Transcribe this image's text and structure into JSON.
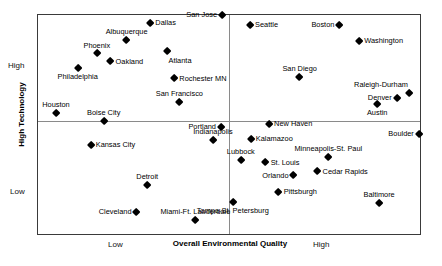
{
  "chart_data": {
    "type": "scatter",
    "title": "",
    "xlabel": "Overall Environmental Quality",
    "ylabel": "High Technology",
    "xlim": [
      0,
      100
    ],
    "ylim": [
      0,
      100
    ],
    "grid": false,
    "legend": "none",
    "x_tick_labels": [
      "Low",
      "High"
    ],
    "y_tick_labels": [
      "High",
      "Low"
    ],
    "quadrant_divider_x": 50,
    "quadrant_divider_y": 51.6,
    "points": [
      {
        "label": "San Jose",
        "x": 48.2,
        "y": 100.0,
        "pos": "left"
      },
      {
        "label": "Dallas",
        "x": 29.4,
        "y": 96.4,
        "pos": "right"
      },
      {
        "label": "Seattle",
        "x": 55.5,
        "y": 95.5,
        "pos": "right"
      },
      {
        "label": "Boston",
        "x": 78.9,
        "y": 95.5,
        "pos": "left"
      },
      {
        "label": "Albuquerque",
        "x": 23.2,
        "y": 88.7,
        "pos": "above"
      },
      {
        "label": "Washington",
        "x": 84.1,
        "y": 88.2,
        "pos": "right"
      },
      {
        "label": "Phoenix",
        "x": 15.4,
        "y": 82.4,
        "pos": "above"
      },
      {
        "label": "Atlanta",
        "x": 33.9,
        "y": 83.3,
        "pos": "belowright"
      },
      {
        "label": "Oakland",
        "x": 19.0,
        "y": 78.7,
        "pos": "right"
      },
      {
        "label": "Philadelphia",
        "x": 10.4,
        "y": 75.6,
        "pos": "below"
      },
      {
        "label": "San Diego",
        "x": 68.5,
        "y": 71.5,
        "pos": "above"
      },
      {
        "label": "Rochester MN",
        "x": 35.7,
        "y": 71.0,
        "pos": "right"
      },
      {
        "label": "Raleigh-Durham",
        "x": 97.1,
        "y": 64.3,
        "pos": "aboveleft"
      },
      {
        "label": "Denver",
        "x": 93.9,
        "y": 62.0,
        "pos": "left"
      },
      {
        "label": "San Francisco",
        "x": 37.0,
        "y": 60.2,
        "pos": "above"
      },
      {
        "label": "Austin",
        "x": 88.8,
        "y": 59.3,
        "pos": "below"
      },
      {
        "label": "Houston",
        "x": 4.7,
        "y": 55.2,
        "pos": "above"
      },
      {
        "label": "Boise City",
        "x": 17.2,
        "y": 51.6,
        "pos": "above"
      },
      {
        "label": "Portland",
        "x": 47.9,
        "y": 48.9,
        "pos": "left"
      },
      {
        "label": "New Haven",
        "x": 60.5,
        "y": 50.2,
        "pos": "right"
      },
      {
        "label": "Boulder",
        "x": 99.7,
        "y": 45.7,
        "pos": "left"
      },
      {
        "label": "Indianapolis",
        "x": 45.8,
        "y": 43.0,
        "pos": "above"
      },
      {
        "label": "Kalamazoo",
        "x": 55.7,
        "y": 43.4,
        "pos": "right"
      },
      {
        "label": "Kansas City",
        "x": 13.8,
        "y": 40.7,
        "pos": "right"
      },
      {
        "label": "Minneapolis-St. Paul",
        "x": 76.0,
        "y": 35.3,
        "pos": "above"
      },
      {
        "label": "Lubbock",
        "x": 53.1,
        "y": 33.9,
        "pos": "above"
      },
      {
        "label": "St. Louis",
        "x": 59.6,
        "y": 32.6,
        "pos": "right"
      },
      {
        "label": "Cedar Rapids",
        "x": 73.2,
        "y": 28.5,
        "pos": "right"
      },
      {
        "label": "Orlando",
        "x": 66.9,
        "y": 26.7,
        "pos": "left"
      },
      {
        "label": "Detroit",
        "x": 28.6,
        "y": 22.2,
        "pos": "above"
      },
      {
        "label": "Pittsburgh",
        "x": 63.0,
        "y": 19.0,
        "pos": "right"
      },
      {
        "label": "Baltimore",
        "x": 89.3,
        "y": 14.0,
        "pos": "above"
      },
      {
        "label": "Tampa-St. Petersburg",
        "x": 51.0,
        "y": 14.5,
        "pos": "below"
      },
      {
        "label": "Cleveland",
        "x": 25.8,
        "y": 10.0,
        "pos": "left"
      },
      {
        "label": "Miami-Ft. Lauderdale",
        "x": 41.2,
        "y": 6.3,
        "pos": "above"
      }
    ]
  }
}
